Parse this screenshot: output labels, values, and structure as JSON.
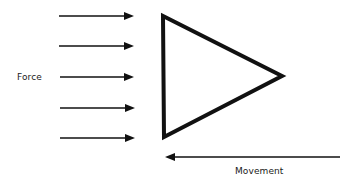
{
  "diagram": {
    "labels": {
      "force": "Force",
      "movement": "Movement"
    },
    "colors": {
      "stroke": "#111111",
      "background": "#ffffff"
    },
    "force_arrows": [
      {
        "x1": 59,
        "x2": 134,
        "y": 16
      },
      {
        "x1": 59,
        "x2": 134,
        "y": 46
      },
      {
        "x1": 60,
        "x2": 134,
        "y": 77
      },
      {
        "x1": 60,
        "x2": 135,
        "y": 108
      },
      {
        "x1": 60,
        "x2": 135,
        "y": 138
      }
    ],
    "triangle": {
      "points": [
        [
          163,
          16
        ],
        [
          164,
          137
        ],
        [
          282,
          76
        ]
      ]
    },
    "movement_arrow": {
      "x1": 340,
      "x2": 165,
      "y": 157
    }
  }
}
